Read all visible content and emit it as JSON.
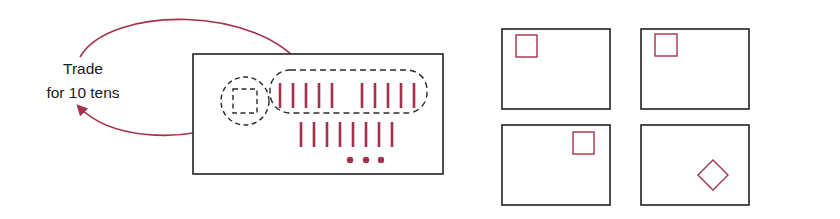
{
  "label": {
    "line1": "Trade",
    "line2": "for 10 tens"
  },
  "colors": {
    "accent": "#a53049",
    "outline": "#222222",
    "dashed": "#2a2a2a"
  },
  "main_panel": {
    "top_row_tens_group_a": 5,
    "top_row_tens_group_b": 5,
    "bottom_row_tens": 8,
    "dots": 3
  },
  "frames": [
    {
      "shape": "square",
      "position": "top-left"
    },
    {
      "shape": "square",
      "position": "top-left"
    },
    {
      "shape": "square",
      "position": "top-right"
    },
    {
      "shape": "diamond",
      "position": "bottom-right"
    }
  ]
}
